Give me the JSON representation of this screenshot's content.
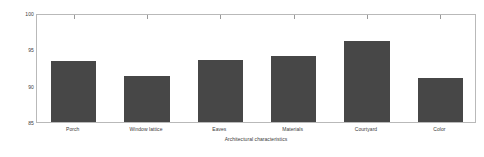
{
  "chart_data": {
    "type": "bar",
    "title": "",
    "subtitle": "",
    "xlabel": "Architectural characteristics",
    "ylabel": "Classification accuracy",
    "categories": [
      "Porch",
      "Window lattice",
      "Eaves",
      "Materials",
      "Courtyard",
      "Color"
    ],
    "values": [
      93.4,
      91.3,
      93.5,
      94.1,
      96.2,
      91.0
    ],
    "series": [
      {
        "name": "Classification accuracy",
        "values": [
          93.4,
          91.3,
          93.5,
          94.1,
          96.2,
          91.0
        ]
      }
    ],
    "ylim": [
      85,
      100
    ],
    "ytick_labels": [
      "85",
      "90",
      "95",
      "100"
    ],
    "ytick_values": [
      85,
      90,
      95,
      100
    ],
    "xlim": [
      0,
      6
    ],
    "grid": false,
    "legend": null,
    "legend_position": "none",
    "bar_color": "#474747",
    "axis_color": "#b9b9b9",
    "background_color": "#ffffff",
    "annotations": []
  }
}
